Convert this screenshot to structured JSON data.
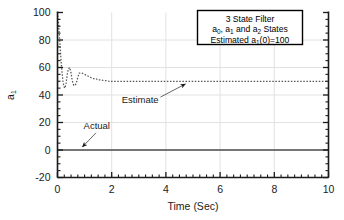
{
  "chart_data": {
    "type": "line",
    "title": "",
    "xlabel": "Time (Sec)",
    "ylabel": "a1",
    "ylabel_display": "a",
    "ylabel_sub": "1",
    "xlim": [
      0,
      10
    ],
    "ylim": [
      -20,
      100
    ],
    "xticks": [
      0,
      2,
      4,
      6,
      8,
      10
    ],
    "yticks": [
      -20,
      0,
      20,
      40,
      60,
      80,
      100
    ],
    "xtick_labels": [
      "0",
      "2",
      "4",
      "6",
      "8",
      "10"
    ],
    "ytick_labels": [
      "-20",
      "0",
      "20",
      "40",
      "60",
      "80",
      "100"
    ],
    "x_minor_interval": 0.25,
    "y_minor_interval": 5,
    "grid": true,
    "grid_color": "#e2e2e2",
    "legend_position": "top-right",
    "series": [
      {
        "name": "Actual",
        "style": "solid",
        "color": "#4d4d4d",
        "x": [
          0,
          10
        ],
        "values": [
          0,
          0
        ]
      },
      {
        "name": "Estimate",
        "style": "dotted",
        "color": "#555555",
        "x": [
          0.0,
          0.04,
          0.08,
          0.12,
          0.16,
          0.2,
          0.24,
          0.28,
          0.32,
          0.36,
          0.4,
          0.45,
          0.5,
          0.55,
          0.6,
          0.65,
          0.7,
          0.75,
          0.8,
          0.9,
          1.0,
          1.1,
          1.2,
          1.3,
          1.4,
          1.5,
          1.6,
          1.7,
          1.8,
          1.9,
          2.0,
          2.2,
          2.4,
          2.6,
          2.8,
          3.0,
          3.4,
          3.8,
          4.2,
          4.6,
          5.0,
          5.5,
          6.0,
          6.5,
          7.0,
          7.5,
          8.0,
          8.5,
          9.0,
          9.5,
          10.0
        ],
        "values": [
          100,
          92,
          80,
          68,
          58,
          50,
          46,
          45,
          49,
          55,
          59,
          60,
          56,
          50,
          47,
          47,
          49,
          53,
          56,
          56,
          55,
          54,
          53,
          52,
          52,
          51,
          51,
          50.5,
          50.5,
          50,
          50,
          50,
          50,
          50,
          50,
          50,
          50,
          50,
          50,
          50,
          50,
          50,
          50,
          50,
          50,
          50,
          50,
          50,
          50,
          50,
          50
        ]
      }
    ],
    "annotations": [
      {
        "name": "actual-annotation",
        "text": "Actual",
        "label_x": 1.45,
        "label_y": 15.5,
        "arrow_from_x": 1.42,
        "arrow_from_y": 12.5,
        "arrow_to_x": 0.92,
        "arrow_to_y": 2.2
      },
      {
        "name": "estimate-annotation",
        "text": "Estimate",
        "label_x": 3.05,
        "label_y": 34.5,
        "arrow_from_x": 3.8,
        "arrow_from_y": 38.5,
        "arrow_to_x": 4.72,
        "arrow_to_y": 48.0
      }
    ],
    "legend_box": {
      "lines": [
        {
          "id": "line1",
          "parts": [
            {
              "t": "3 State Filter",
              "sub": false
            }
          ]
        },
        {
          "id": "line2",
          "parts": [
            {
              "t": "a",
              "sub": false
            },
            {
              "t": "0",
              "sub": true
            },
            {
              "t": ", a",
              "sub": false
            },
            {
              "t": "1",
              "sub": true
            },
            {
              "t": " and a",
              "sub": false
            },
            {
              "t": "2",
              "sub": true
            },
            {
              "t": " States",
              "sub": false
            }
          ]
        },
        {
          "id": "line3",
          "parts": [
            {
              "t": "Estimated a",
              "sub": false
            },
            {
              "t": "1",
              "sub": true
            },
            {
              "t": "(0)=100",
              "sub": false
            }
          ]
        }
      ],
      "line1_text": "3 State Filter",
      "line2_text": "a0, a1 and a2 States",
      "line3_text": "Estimated a1(0)=100"
    }
  },
  "colors": {
    "axis": "#1a1a1a",
    "grid": "#e2e2e2",
    "actual": "#4d4d4d",
    "estimate": "#555555",
    "text": "#1a1a1a",
    "legend_border": "#000000",
    "background": "#ffffff"
  }
}
